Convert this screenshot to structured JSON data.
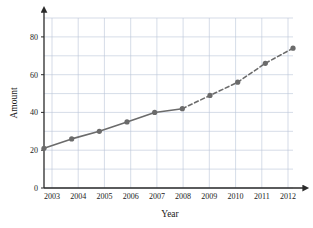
{
  "chart_data": {
    "type": "line",
    "title": "",
    "xlabel": "Year",
    "ylabel": "Amount",
    "categories": [
      "2003",
      "2004",
      "2005",
      "2006",
      "2007",
      "2008",
      "2009",
      "2010",
      "2011",
      "2012"
    ],
    "x": [
      2003,
      2004,
      2005,
      2006,
      2007,
      2008,
      2009,
      2010,
      2011,
      2012
    ],
    "values": [
      21,
      26,
      30,
      35,
      40,
      42,
      49,
      56,
      66,
      74
    ],
    "series": [
      {
        "name": "Amount",
        "values": [
          21,
          26,
          30,
          35,
          40,
          42,
          49,
          56,
          66,
          74
        ],
        "style": "solid-then-dashed",
        "solid_through_index": 5,
        "color": "#6b6b6b",
        "marker": "circle"
      }
    ],
    "xlim": [
      2003,
      2012
    ],
    "ylim": [
      0,
      90
    ],
    "y_ticks": [
      0,
      20,
      40,
      60,
      80
    ],
    "y_tick_labels": [
      "0",
      "20",
      "40",
      "60",
      "80"
    ],
    "y_minor_step": 10,
    "x_ticks": [
      2003,
      2004,
      2005,
      2006,
      2007,
      2008,
      2009,
      2010,
      2011,
      2012
    ],
    "grid": true,
    "grid_color": "#b9c4d6",
    "legend": "none",
    "axis_arrows": true,
    "annotations": []
  },
  "axes": {
    "x_label": "Year",
    "y_label": "Amount"
  },
  "colors": {
    "line": "#6b6b6b",
    "marker": "#6b6b6b",
    "grid": "#b9c4d6",
    "axis": "#2a2a2a",
    "background": "#ffffff"
  },
  "ticks": {
    "y": [
      "0",
      "20",
      "40",
      "60",
      "80"
    ],
    "x": [
      "2003",
      "2004",
      "2005",
      "2006",
      "2007",
      "2008",
      "2009",
      "2010",
      "2011",
      "2012"
    ]
  }
}
